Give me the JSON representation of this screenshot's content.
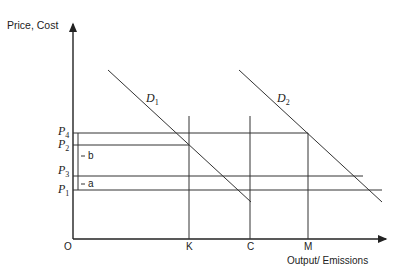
{
  "axes": {
    "y_label": "Price, Cost",
    "x_label": "Output/ Emissions",
    "origin_label": "O"
  },
  "price_levels": [
    {
      "id": "P4",
      "base": "P",
      "sub": "4"
    },
    {
      "id": "P2",
      "base": "P",
      "sub": "2"
    },
    {
      "id": "P3",
      "base": "P",
      "sub": "3"
    },
    {
      "id": "P1",
      "base": "P",
      "sub": "1"
    }
  ],
  "quantity_levels": [
    "K",
    "C",
    "M"
  ],
  "curves": [
    {
      "base": "D",
      "sub": "1"
    },
    {
      "base": "D",
      "sub": "2"
    }
  ],
  "brackets": {
    "b": "b",
    "a": "a"
  },
  "colors": {
    "line": "#222222",
    "text": "#222222"
  }
}
